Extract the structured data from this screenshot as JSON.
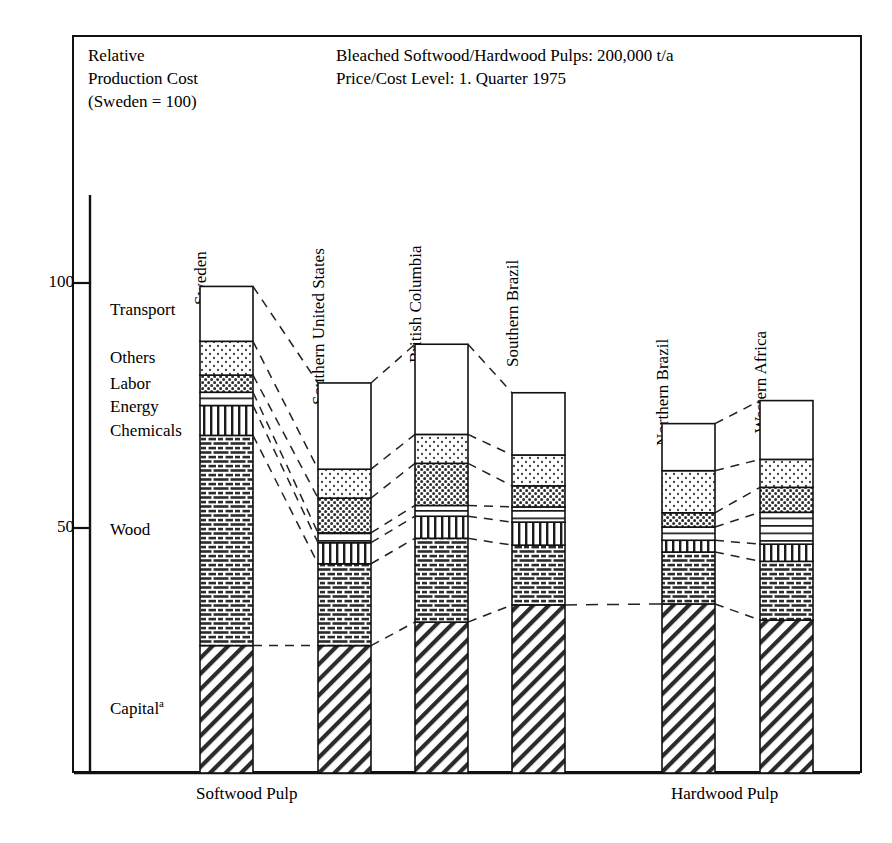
{
  "header": {
    "left_lines": "Relative\nProduction Cost\n(Sweden = 100)",
    "right_lines": "Bleached Softwood/Hardwood Pulps: 200,000 t/a\nPrice/Cost Level: 1. Quarter 1975"
  },
  "axis": {
    "tick_100": "100",
    "tick_50": "50",
    "bottom_left": "Softwood Pulp",
    "bottom_right": "Hardwood Pulp"
  },
  "category_labels": {
    "transport": "Transport",
    "others": "Others",
    "labor": "Labor",
    "energy": "Energy",
    "chemicals": "Chemicals",
    "wood": "Wood",
    "capital": "Capital",
    "capital_sup": "a"
  },
  "bar_labels": {
    "sweden": "Sweden",
    "southern_united_states": "Southern United States",
    "british_columbia": "British Columbia",
    "southern_brazil": "Southern Brazil",
    "northern_brazil": "Northern Brazil",
    "western_africa": "Western Africa"
  },
  "chart_data": {
    "type": "bar",
    "title": "Relative Production Cost (Sweden = 100)",
    "subtitle": "Bleached Softwood/Hardwood Pulps: 200,000 t/a — Price/Cost Level: 1. Quarter 1975",
    "stacked": true,
    "xlabel": "",
    "ylabel": "Relative Production Cost (Sweden = 100)",
    "ylim": [
      0,
      105
    ],
    "yticks": [
      50,
      100
    ],
    "grid": false,
    "legend_position": "left-inline",
    "group_labels": [
      "Softwood Pulp",
      "Hardwood Pulp"
    ],
    "groups": [
      {
        "name": "Softwood Pulp",
        "categories": [
          "Sweden",
          "Southern United States",
          "British Columbia",
          "Southern Brazil"
        ]
      },
      {
        "name": "Hardwood Pulp",
        "categories": [
          "Northern Brazil",
          "Western Africa"
        ]
      }
    ],
    "categories": [
      "Sweden",
      "Southern United States",
      "British Columbia",
      "Southern Brazil",
      "Northern Brazil",
      "Western Africa"
    ],
    "series": [
      {
        "name": "Capital",
        "pattern": "diagonal-hatch",
        "values": [
          26.0,
          26.0,
          30.8,
          34.3,
          34.5,
          31.2
        ]
      },
      {
        "name": "Wood",
        "pattern": "brick-dashes",
        "values": [
          42.9,
          16.7,
          17.1,
          12.2,
          10.6,
          12.0
        ]
      },
      {
        "name": "Chemicals",
        "pattern": "vertical-lines",
        "values": [
          6.1,
          4.3,
          4.5,
          4.7,
          2.4,
          3.5
        ]
      },
      {
        "name": "Energy",
        "pattern": "horizontal-lines",
        "values": [
          2.7,
          2.0,
          2.2,
          3.1,
          2.7,
          6.5
        ]
      },
      {
        "name": "Labor",
        "pattern": "dense-dots",
        "values": [
          3.5,
          7.1,
          8.6,
          4.3,
          2.9,
          5.1
        ]
      },
      {
        "name": "Others",
        "pattern": "light-dots",
        "values": [
          6.9,
          5.9,
          5.9,
          6.3,
          8.6,
          5.7
        ]
      },
      {
        "name": "Transport",
        "pattern": "white",
        "values": [
          11.2,
          17.6,
          18.4,
          12.7,
          9.6,
          12.0
        ]
      }
    ],
    "totals": [
      100.0,
      79.6,
      87.5,
      87.6,
      71.2,
      76.0
    ]
  },
  "colors": {
    "line": "#111111",
    "fill": "#ffffff",
    "frame": "#111111"
  }
}
